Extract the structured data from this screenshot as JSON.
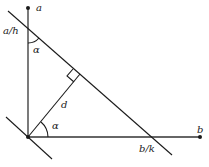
{
  "diagram": {
    "type": "geometry",
    "labels": {
      "point_a": "a",
      "point_b": "b",
      "intercept_a": "a/h",
      "intercept_b": "b/k",
      "distance": "d",
      "angle_top": "α",
      "angle_origin": "α"
    },
    "colors": {
      "stroke": "#1a1a1a",
      "axis": "#333333",
      "background": "#ffffff"
    }
  }
}
